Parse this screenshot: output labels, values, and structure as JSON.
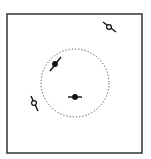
{
  "diagram": {
    "frame": {
      "x": 7,
      "y": 14,
      "width": 135,
      "height": 139,
      "stroke": "#333333"
    },
    "circle": {
      "cx": 75,
      "cy": 83,
      "r": 34,
      "stroke": "#444444",
      "style": "dotted"
    },
    "markers": [
      {
        "id": "top-right",
        "type": "open",
        "cx": 109,
        "cy": 27,
        "line": [
          103,
          22,
          116,
          32
        ]
      },
      {
        "id": "inner-upper",
        "type": "filled",
        "cx": 55,
        "cy": 64,
        "line": [
          50,
          71,
          61,
          57
        ]
      },
      {
        "id": "center",
        "type": "filled",
        "cx": 75,
        "cy": 97,
        "line": [
          68,
          97,
          82,
          97
        ]
      },
      {
        "id": "left",
        "type": "open",
        "cx": 34,
        "cy": 103,
        "line": [
          31,
          96,
          38,
          111
        ]
      }
    ],
    "colors": {
      "ink": "#111111",
      "frame": "#333333"
    }
  }
}
